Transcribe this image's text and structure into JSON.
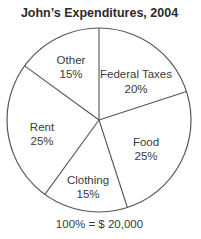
{
  "chart_data": {
    "type": "pie",
    "title": "John’s Expenditures, 2004",
    "caption": "100% = $ 20,000",
    "total": 20000,
    "currency": "$",
    "start_angle_deg": 0,
    "direction": "clockwise",
    "slices": [
      {
        "label": "Federal Taxes",
        "value": 20,
        "percent_text": "20%"
      },
      {
        "label": "Food",
        "value": 25,
        "percent_text": "25%"
      },
      {
        "label": "Clothing",
        "value": 15,
        "percent_text": "15%"
      },
      {
        "label": "Rent",
        "value": 25,
        "percent_text": "25%"
      },
      {
        "label": "Other",
        "value": 15,
        "percent_text": "15%"
      }
    ],
    "fill_color": "#ffffff",
    "stroke_color": "#555555",
    "legend": "none (labels inside slices)"
  }
}
